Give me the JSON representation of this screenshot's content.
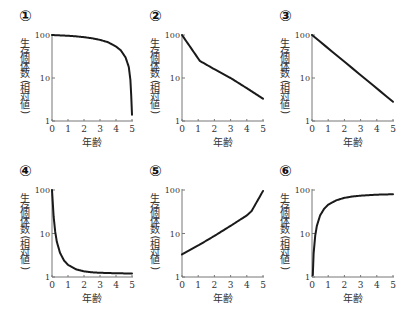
{
  "chart_data": [
    {
      "id": "1",
      "label": "①",
      "type": "line",
      "title": "",
      "xlabel": "年齢",
      "ylabel": "生存個体数（相対値）",
      "yscale": "log",
      "ylim": [
        1,
        100
      ],
      "xlim": [
        0,
        5
      ],
      "xticks": [
        "0",
        "1",
        "2",
        "3",
        "4",
        "5"
      ],
      "yticks": [
        "1",
        "10",
        "100"
      ],
      "x": [
        0,
        0.5,
        1,
        1.5,
        2,
        2.5,
        3,
        3.5,
        4,
        4.3,
        4.6,
        4.8,
        4.9,
        4.95,
        5
      ],
      "values": [
        100,
        98,
        96,
        93,
        89,
        84,
        77,
        68,
        54,
        44,
        30,
        18,
        9,
        4,
        1.4
      ],
      "grid": false,
      "legend": null
    },
    {
      "id": "2",
      "label": "②",
      "type": "line",
      "title": "",
      "xlabel": "年齢",
      "ylabel": "生存個体数（相対値）",
      "yscale": "log",
      "ylim": [
        1,
        100
      ],
      "xlim": [
        0,
        5
      ],
      "xticks": [
        "0",
        "1",
        "2",
        "3",
        "4",
        "5"
      ],
      "yticks": [
        "1",
        "10",
        "100"
      ],
      "x": [
        0,
        1.1,
        2,
        3,
        4,
        5
      ],
      "values": [
        100,
        25,
        16,
        10,
        5.8,
        3.3
      ],
      "grid": false,
      "legend": null
    },
    {
      "id": "3",
      "label": "③",
      "type": "line",
      "title": "",
      "xlabel": "年齢",
      "ylabel": "生存個体数（相対値）",
      "yscale": "log",
      "ylim": [
        1,
        100
      ],
      "xlim": [
        0,
        5
      ],
      "xticks": [
        "0",
        "1",
        "2",
        "3",
        "4",
        "5"
      ],
      "yticks": [
        "1",
        "10",
        "100"
      ],
      "x": [
        0,
        5
      ],
      "values": [
        100,
        2.8
      ],
      "grid": false,
      "legend": null
    },
    {
      "id": "4",
      "label": "④",
      "type": "line",
      "title": "",
      "xlabel": "年齢",
      "ylabel": "生存個体数（相対値）",
      "yscale": "log",
      "ylim": [
        1,
        100
      ],
      "xlim": [
        0,
        5
      ],
      "xticks": [
        "0",
        "1",
        "2",
        "3",
        "4",
        "5"
      ],
      "yticks": [
        "1",
        "10",
        "100"
      ],
      "x": [
        0,
        0.05,
        0.1,
        0.2,
        0.3,
        0.5,
        0.75,
        1,
        1.5,
        2,
        2.5,
        3,
        4,
        5
      ],
      "values": [
        100,
        50,
        25,
        11,
        6.5,
        3.6,
        2.4,
        1.9,
        1.5,
        1.35,
        1.28,
        1.25,
        1.22,
        1.2
      ],
      "grid": false,
      "legend": null
    },
    {
      "id": "5",
      "label": "⑤",
      "type": "line",
      "title": "",
      "xlabel": "年齢",
      "ylabel": "生存個体数（相対値）",
      "yscale": "log",
      "ylim": [
        1,
        100
      ],
      "xlim": [
        0,
        5
      ],
      "xticks": [
        "0",
        "1",
        "2",
        "3",
        "4",
        "5"
      ],
      "yticks": [
        "1",
        "10",
        "100"
      ],
      "x": [
        0,
        1,
        2,
        3,
        4,
        4.3,
        5
      ],
      "values": [
        3.3,
        5.3,
        8.8,
        15,
        26,
        33,
        95
      ],
      "grid": false,
      "legend": null
    },
    {
      "id": "6",
      "label": "⑥",
      "type": "line",
      "title": "",
      "xlabel": "年齢",
      "ylabel": "生存個体数（相対値）",
      "yscale": "log",
      "ylim": [
        1,
        100
      ],
      "xlim": [
        0,
        5
      ],
      "xticks": [
        "0",
        "1",
        "2",
        "3",
        "4",
        "5"
      ],
      "yticks": [
        "1",
        "10",
        "100"
      ],
      "x": [
        0.05,
        0.1,
        0.2,
        0.3,
        0.5,
        0.75,
        1,
        1.5,
        2,
        2.5,
        3,
        4,
        5
      ],
      "values": [
        1.1,
        3.5,
        9,
        15,
        26,
        37,
        46,
        58,
        66,
        71,
        74,
        78,
        80
      ],
      "grid": false,
      "legend": null
    }
  ],
  "panels_layout": {
    "x0": [
      52,
      182,
      312
    ],
    "x5": [
      132,
      263,
      393
    ],
    "row_y100": [
      35,
      190
    ],
    "row_y1": [
      121,
      277
    ]
  },
  "style": {
    "axis_color": "#777777",
    "curve_color": "#1a1a1a",
    "text_color": "#333333"
  }
}
